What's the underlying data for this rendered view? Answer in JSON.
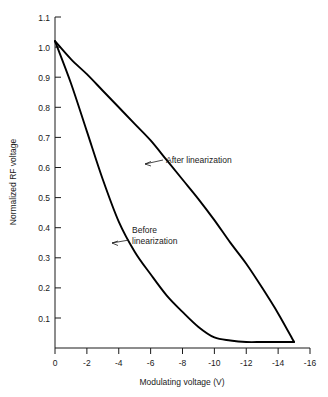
{
  "chart_data": {
    "type": "line",
    "title": "",
    "xlabel": "Modulating voltage (V)",
    "ylabel": "Normalized RF voltage",
    "xlim": [
      0,
      -16
    ],
    "ylim": [
      0,
      1.1
    ],
    "grid": false,
    "legend_position": "inline-annotations",
    "x_ticks": [
      "0",
      "-2",
      "-4",
      "-6",
      "-8",
      "-10",
      "-12",
      "-14",
      "-16"
    ],
    "x_tick_values": [
      0,
      -2,
      -4,
      -6,
      -8,
      -10,
      -12,
      -14,
      -16
    ],
    "y_ticks": [
      "0",
      "0.1",
      "0.2",
      "0.3",
      "0.4",
      "0.5",
      "0.6",
      "0.7",
      "0.8",
      "0.9",
      "1.0",
      "1.1"
    ],
    "y_tick_values": [
      0,
      0.1,
      0.2,
      0.3,
      0.4,
      0.5,
      0.6,
      0.7,
      0.8,
      0.9,
      1.0,
      1.1
    ],
    "series": [
      {
        "name": "After linearization",
        "x": [
          0,
          -1,
          -2,
          -3,
          -4,
          -5,
          -6,
          -7,
          -8,
          -9,
          -10,
          -11,
          -12,
          -13,
          -14,
          -15
        ],
        "values": [
          1.02,
          0.96,
          0.91,
          0.855,
          0.8,
          0.745,
          0.69,
          0.625,
          0.56,
          0.495,
          0.425,
          0.35,
          0.28,
          0.2,
          0.115,
          0.02
        ]
      },
      {
        "name": "Before linearization",
        "x": [
          0,
          -1,
          -2,
          -3,
          -4,
          -5,
          -6,
          -7,
          -8,
          -9,
          -10,
          -11,
          -12,
          -13,
          -14,
          -15
        ],
        "values": [
          1.02,
          0.88,
          0.72,
          0.56,
          0.42,
          0.32,
          0.245,
          0.175,
          0.12,
          0.07,
          0.035,
          0.025,
          0.02,
          0.02,
          0.02,
          0.02
        ]
      }
    ],
    "annotations": [
      {
        "id": "after",
        "label_line1": "After linearization",
        "label_line2": ""
      },
      {
        "id": "before",
        "label_line1": "Before",
        "label_line2": "linearization"
      }
    ]
  },
  "colors": {
    "curve": "#000000",
    "axis": "#1a1a1a",
    "background": "#ffffff"
  }
}
